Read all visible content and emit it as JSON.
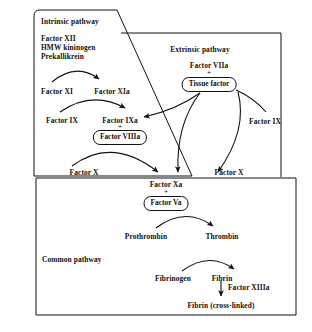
{
  "diagram": {
    "ink_color": "#111111",
    "background": "#ffffff"
  },
  "panels": {
    "intrinsic": {
      "label": "Intrinsic pathway"
    },
    "extrinsic": {
      "label": "Extrinsic pathway"
    },
    "common": {
      "label": "Common pathway"
    }
  },
  "intrinsic": {
    "initiators": "Factor XII\nHMW kininogen\nPrekallikrein",
    "initiator_lines": [
      "Factor XII",
      "HMW kininogen",
      "Prekallikrein"
    ],
    "factor_xi": "Factor XI",
    "factor_xia": "Factor XIa",
    "factor_ix": "Factor IX",
    "factor_ixa": "Factor IXa",
    "plus_1": "+",
    "factor_viiia": "Factor VIIIa",
    "factor_x": "Factor X"
  },
  "extrinsic": {
    "factor_viia": "Factor VIIa",
    "plus_1": "+",
    "tissue_factor": "Tissue factor",
    "factor_ix": "Factor IX",
    "factor_x": "Factor X"
  },
  "common": {
    "factor_xa": "Factor Xa",
    "plus_1": "+",
    "factor_va": "Factor Va",
    "prothrombin": "Prothrombin",
    "thrombin": "Thrombin",
    "fibrinogen": "Fibrinogen",
    "fibrin": "Fibrin",
    "factor_xiiia": "Factor XIIIa",
    "fibrin_cross_linked": "Fibrin (cross-linked)"
  }
}
